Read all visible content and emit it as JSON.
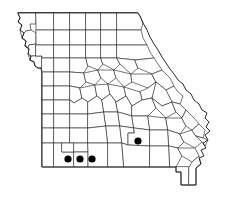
{
  "figure": {
    "name": "missouri-county-distribution-map",
    "state": "Missouri",
    "background_color": "#ffffff"
  },
  "style": {
    "county_stroke_color": "#3a3a3a",
    "state_stroke_color": "#2a2a2a",
    "county_fill_color": "#ffffff",
    "dot_color": "#000000",
    "county_stroke_width": 0.7,
    "state_stroke_width": 1.0
  },
  "chart_data": {
    "type": "map",
    "subtitle": "",
    "xlabel": "",
    "ylabel": "",
    "legend_position": "none",
    "grid": false,
    "region": "Missouri",
    "marker_shape": "circle",
    "marker_color": "#000000",
    "marker_radius_px": 3.6,
    "total_marked_counties": 4,
    "points": [
      {
        "id": "dot-1",
        "label": "Newton",
        "x": 68,
        "y": 159,
        "value": 1
      },
      {
        "id": "dot-2",
        "label": "McDonald-Barry",
        "x": 80,
        "y": 159,
        "value": 1
      },
      {
        "id": "dot-3",
        "label": "Barry-Stone",
        "x": 92,
        "y": 159,
        "value": 1
      },
      {
        "id": "dot-4",
        "label": "Shannon-Howell",
        "x": 138,
        "y": 141,
        "value": 1
      }
    ]
  },
  "map_geometry": {
    "state_outline": "M 18,13 L 20,18 L 18,22 L 22,25 L 20,30 L 24,33 L 22,38 L 26,41 L 25,46 L 29,49 L 28,54 L 31,56 L 30,60 L 34,62 L 35,66 L 38,68 L 41,68 L 42,74 L 42,167 L 176,167 L 176,172 L 181,172 L 181,185 L 196,185 L 196,168 L 201,164 L 199,158 L 204,156 L 201,150 L 206,148 L 203,143 L 208,140 L 205,135 L 210,131 L 206,127 L 209,122 L 205,118 L 207,113 L 202,110 L 199,104 L 194,100 L 191,94 L 186,90 L 183,84 L 178,80 L 174,74 L 170,69 L 166,63 L 162,57 L 158,50 L 154,44 L 150,37 L 147,30 L 143,23 L 140,16 L 138,13 Z",
    "dot_count": 4
  }
}
